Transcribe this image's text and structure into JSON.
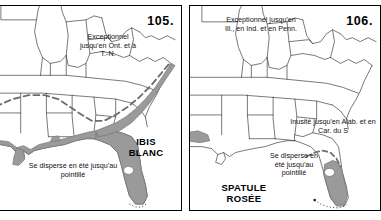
{
  "figure": {
    "type": "range-map-pair",
    "language": "fr",
    "region": "Sud-est des États-Unis",
    "legend_meaning": {
      "gray_fill": "aire de répartition",
      "dashed_line": "limite de dispersion estivale",
      "dotted_line": "pointillé"
    }
  },
  "panels": [
    {
      "id": "left",
      "number": "105.",
      "species": "IBIS\nBLANC",
      "species_line1": "IBIS",
      "species_line2": "BLANC",
      "notes": {
        "northeast": "Exceptionnel jusqu'en Ont. et à T.-N.",
        "dispersal": "Se disperse en été jusqu'au pointillé"
      }
    },
    {
      "id": "right",
      "number": "106.",
      "species": "SPATULE\nROSÉE",
      "species_line1": "SPATULE",
      "species_line2": "ROSÉE",
      "notes": {
        "northeast": "Exceptionnel jusqu'en Ill., en Ind. et en Penn.",
        "unusual": "Inusité jusqu'en Alab. et en Car. du S",
        "dispersal": "Se disperse en été jusqu'au pointillé"
      }
    }
  ],
  "colors": {
    "range_fill": "#9a9a9a",
    "range_stroke": "#6e6e6e",
    "state_line": "#3d3d3d",
    "border": "#000000",
    "background": "#ffffff",
    "text": "#111111"
  }
}
